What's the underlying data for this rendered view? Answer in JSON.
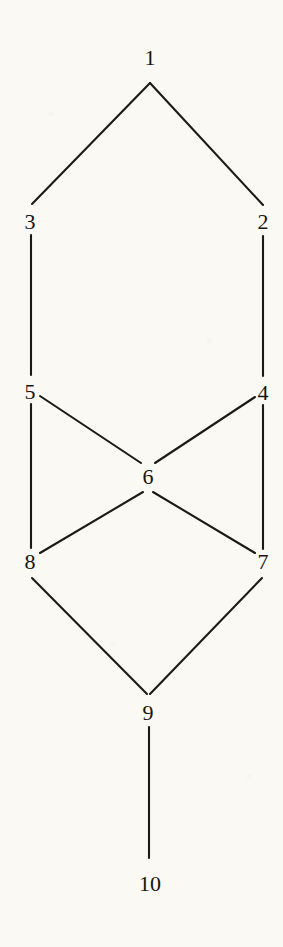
{
  "figure": {
    "kind": "node-link-diagram",
    "background_color": "#faf9f3",
    "ink_color": "#1c1a14",
    "width": 283,
    "height": 947
  },
  "chart_data": {
    "type": "diagram",
    "subtype": "hasse-diagram",
    "title": "",
    "xlabel": "",
    "ylabel": "",
    "grid": false,
    "legend": null,
    "nodes": [
      {
        "id": "1",
        "label": "1",
        "x": 150,
        "y": 58,
        "port_x": 150,
        "port_y": 83
      },
      {
        "id": "2",
        "label": "2",
        "x": 263,
        "y": 222,
        "port_x": 263,
        "port_y": 205
      },
      {
        "id": "3",
        "label": "3",
        "x": 30,
        "y": 222,
        "port_x": 32,
        "port_y": 204
      },
      {
        "id": "4",
        "label": "4",
        "x": 263,
        "y": 393,
        "port_x": 263,
        "port_y": 376
      },
      {
        "id": "5",
        "label": "5",
        "x": 30,
        "y": 392,
        "port_x": 31,
        "port_y": 375
      },
      {
        "id": "6",
        "label": "6",
        "x": 148,
        "y": 477,
        "port_x": 147,
        "port_y": 460
      },
      {
        "id": "7",
        "label": "7",
        "x": 263,
        "y": 562,
        "port_x": 262,
        "port_y": 549
      },
      {
        "id": "8",
        "label": "8",
        "x": 30,
        "y": 562,
        "port_x": 31,
        "port_y": 548
      },
      {
        "id": "9",
        "label": "9",
        "x": 148,
        "y": 713,
        "port_x": 148,
        "port_y": 694
      },
      {
        "id": "10",
        "label": "10",
        "x": 150,
        "y": 884,
        "port_x": 149,
        "port_y": 858
      }
    ],
    "edges": [
      {
        "from": "1",
        "to": "3",
        "x1": 150,
        "y1": 83,
        "x2": 32,
        "y2": 204
      },
      {
        "from": "1",
        "to": "2",
        "x1": 150,
        "y1": 83,
        "x2": 263,
        "y2": 205
      },
      {
        "from": "3",
        "to": "5",
        "x1": 31,
        "y1": 235,
        "x2": 31,
        "y2": 375
      },
      {
        "from": "2",
        "to": "4",
        "x1": 263,
        "y1": 236,
        "x2": 263,
        "y2": 376
      },
      {
        "from": "5",
        "to": "6",
        "x1": 40,
        "y1": 396,
        "x2": 141,
        "y2": 463
      },
      {
        "from": "4",
        "to": "6",
        "x1": 255,
        "y1": 397,
        "x2": 155,
        "y2": 463
      },
      {
        "from": "5",
        "to": "8",
        "x1": 31,
        "y1": 404,
        "x2": 31,
        "y2": 548
      },
      {
        "from": "4",
        "to": "7",
        "x1": 263,
        "y1": 405,
        "x2": 263,
        "y2": 549
      },
      {
        "from": "6",
        "to": "8",
        "x1": 143,
        "y1": 492,
        "x2": 40,
        "y2": 553
      },
      {
        "from": "6",
        "to": "7",
        "x1": 153,
        "y1": 492,
        "x2": 255,
        "y2": 553
      },
      {
        "from": "8",
        "to": "9",
        "x1": 32,
        "y1": 578,
        "x2": 147,
        "y2": 694
      },
      {
        "from": "7",
        "to": "9",
        "x1": 262,
        "y1": 578,
        "x2": 150,
        "y2": 694
      },
      {
        "from": "9",
        "to": "10",
        "x1": 149,
        "y1": 727,
        "x2": 149,
        "y2": 858
      }
    ]
  }
}
